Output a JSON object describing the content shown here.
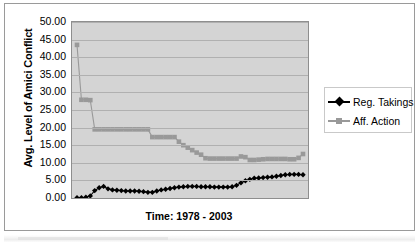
{
  "chart_data": {
    "type": "line",
    "title": "",
    "xlabel": "Time: 1978 - 2003",
    "ylabel": "Avg. Level of Amici Conflict",
    "ylim": [
      0,
      50
    ],
    "ytick_labels": [
      "50.00",
      "45.00",
      "40.00",
      "35.00",
      "30.00",
      "25.00",
      "20.00",
      "15.00",
      "10.00",
      "5.00",
      "0.00"
    ],
    "ytick_values": [
      50,
      45,
      40,
      35,
      30,
      25,
      20,
      15,
      10,
      5,
      0
    ],
    "xtick_labels": [],
    "grid": "horizontal",
    "legend_position": "right",
    "plot_background": "#d4d4d4",
    "x": [
      1,
      2,
      3,
      4,
      5,
      6,
      7,
      8,
      9,
      10,
      11,
      12,
      13,
      14,
      15,
      16,
      17,
      18,
      19,
      20,
      21,
      22,
      23,
      24,
      25,
      26,
      27,
      28,
      29,
      30,
      31,
      32,
      33,
      34,
      35,
      36,
      37,
      38,
      39,
      40,
      41,
      42,
      43,
      44,
      45,
      46,
      47,
      48,
      49,
      50,
      51,
      52
    ],
    "series": [
      {
        "name": "Reg. Takings",
        "color": "#000000",
        "marker": "diamond",
        "values": [
          0.1,
          0.1,
          0.2,
          0.6,
          2.1,
          2.9,
          3.3,
          2.6,
          2.3,
          2.2,
          2.1,
          2.0,
          2.0,
          2.0,
          1.9,
          1.8,
          1.6,
          1.6,
          2.0,
          2.3,
          2.5,
          2.7,
          2.9,
          3.1,
          3.2,
          3.3,
          3.3,
          3.3,
          3.2,
          3.2,
          3.2,
          3.1,
          3.1,
          3.1,
          3.1,
          3.2,
          3.6,
          4.3,
          4.9,
          5.3,
          5.6,
          5.7,
          5.8,
          5.9,
          6.0,
          6.2,
          6.4,
          6.6,
          6.7,
          6.7,
          6.7,
          6.6
        ]
      },
      {
        "name": "Aff. Action",
        "color": "#999999",
        "marker": "square",
        "values": [
          43.5,
          27.9,
          27.9,
          27.8,
          19.5,
          19.5,
          19.5,
          19.5,
          19.5,
          19.5,
          19.5,
          19.5,
          19.5,
          19.5,
          19.5,
          19.5,
          19.5,
          17.3,
          17.3,
          17.3,
          17.3,
          17.3,
          17.3,
          16.0,
          15.0,
          14.3,
          13.6,
          12.9,
          12.3,
          11.3,
          11.2,
          11.2,
          11.2,
          11.2,
          11.2,
          11.2,
          11.2,
          11.8,
          11.6,
          10.8,
          10.8,
          10.9,
          11.0,
          11.1,
          11.1,
          11.1,
          11.1,
          11.1,
          11.0,
          11.0,
          11.4,
          12.5
        ]
      }
    ]
  },
  "legend": {
    "entries": [
      {
        "label": "Reg. Takings"
      },
      {
        "label": "Aff. Action"
      }
    ]
  }
}
